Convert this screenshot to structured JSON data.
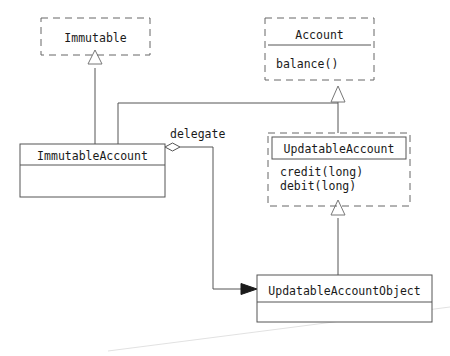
{
  "diagram": {
    "kind": "uml-class-diagram",
    "classes": [
      {
        "id": "immutable",
        "name": "Immutable",
        "stereotype": "interface",
        "border": "dashed",
        "members": []
      },
      {
        "id": "account",
        "name": "Account",
        "stereotype": "interface",
        "border": "dashed",
        "members": [
          "balance()"
        ]
      },
      {
        "id": "immutable-account",
        "name": "ImmutableAccount",
        "stereotype": "class",
        "border": "solid",
        "members": []
      },
      {
        "id": "updatable-account",
        "name": "UpdatableAccount",
        "stereotype": "interface",
        "border": "dashed",
        "members": [
          "credit(long)",
          "debit(long)"
        ]
      },
      {
        "id": "updatable-account-object",
        "name": "UpdatableAccountObject",
        "stereotype": "class",
        "border": "solid",
        "members": []
      }
    ],
    "relationships": [
      {
        "id": "rel-immutableaccount-immutable",
        "type": "realization",
        "from": "ImmutableAccount",
        "to": "Immutable",
        "label": ""
      },
      {
        "id": "rel-immutableaccount-account",
        "type": "realization",
        "from": "ImmutableAccount",
        "to": "Account",
        "label": ""
      },
      {
        "id": "rel-updatableaccount-account",
        "type": "generalization",
        "from": "UpdatableAccount",
        "to": "Account",
        "label": ""
      },
      {
        "id": "rel-updatableaccountobject-updatableaccount",
        "type": "realization",
        "from": "UpdatableAccountObject",
        "to": "UpdatableAccount",
        "label": ""
      },
      {
        "id": "rel-delegate",
        "type": "aggregation",
        "from": "ImmutableAccount",
        "to": "UpdatableAccountObject",
        "label": "delegate"
      }
    ],
    "labels": {
      "delegate": "delegate"
    },
    "colors": {
      "line": "#555555",
      "dashed_line": "#666666",
      "text": "#1a1a1a",
      "background": "#ffffff",
      "artifact": "#e2e2e2"
    }
  }
}
